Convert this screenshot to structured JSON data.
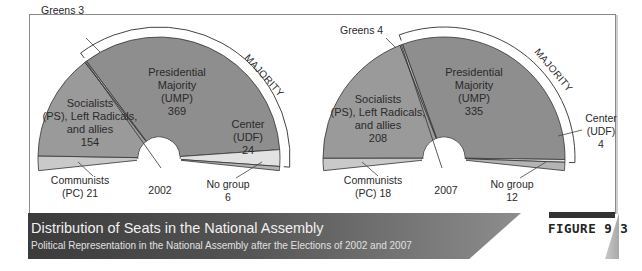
{
  "colors": {
    "communists": "#c9c9c9",
    "socialists": "#9a9a9a",
    "greens": "#b5b5b5",
    "ump": "#8e8e8e",
    "udf": "#e2e2e2",
    "no_group": "#b4b4b4",
    "outline": "#333333",
    "banner_dark": "#3b3b3b",
    "banner_light": "#8d8d8d"
  },
  "caption": {
    "title": "Distribution of Seats in the National Assembly",
    "subtitle": "Political Representation in the National Assembly after the Elections of 2002 and 2007",
    "figure_label": "FIGURE 9.3"
  },
  "chart_data": [
    {
      "type": "pie",
      "subtype": "semicircle-parliament",
      "title": "2002",
      "categories": [
        "Communists (PC)",
        "Socialists (PS), Left Radicals, and allies",
        "Greens",
        "Presidential Majority (UMP)",
        "Center (UDF)",
        "No group"
      ],
      "values": [
        21,
        154,
        3,
        369,
        24,
        6
      ],
      "annotation": "MAJORITY",
      "majority_spans": [
        "Presidential Majority (UMP)",
        "Center (UDF)"
      ]
    },
    {
      "type": "pie",
      "subtype": "semicircle-parliament",
      "title": "2007",
      "categories": [
        "Communists (PC)",
        "Socialists (PS), Left Radicals, and allies",
        "Greens",
        "Presidential Majority (UMP)",
        "Center (UDF)",
        "No group"
      ],
      "values": [
        18,
        208,
        4,
        335,
        4,
        12
      ],
      "annotation": "MAJORITY",
      "majority_spans": [
        "Presidential Majority (UMP)",
        "Center (UDF)"
      ]
    }
  ],
  "charts": {
    "c2002": {
      "year": "2002",
      "majority": "MAJORITY",
      "greens": "Greens 3",
      "ump": [
        "Presidential",
        "Majority",
        "(UMP)",
        "369"
      ],
      "ps": [
        "Socialists",
        "(PS), Left Radicals,",
        "and allies",
        "154"
      ],
      "udf": [
        "Center",
        "(UDF)",
        "24"
      ],
      "pc": [
        "Communists",
        "(PC)  21"
      ],
      "nogroup": [
        "No group",
        "6"
      ]
    },
    "c2007": {
      "year": "2007",
      "majority": "MAJORITY",
      "greens": "Greens 4",
      "ump": [
        "Presidential",
        "Majority",
        "(UMP)",
        "335"
      ],
      "ps": [
        "Socialists",
        "(PS), Left Radicals,",
        "and allies",
        "208"
      ],
      "udf": [
        "Center",
        "(UDF)",
        "4"
      ],
      "pc": [
        "Communists",
        "(PC) 18"
      ],
      "nogroup": [
        "No group",
        "12"
      ]
    }
  }
}
